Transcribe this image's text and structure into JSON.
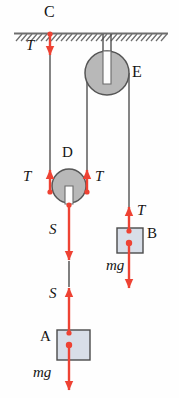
{
  "figure": {
    "colors": {
      "force_arrow": "#ee4233",
      "rope": "#4a4a4a",
      "pulley_fill": "#b8b8b8",
      "pulley_stroke": "#565656",
      "block_fill": "#d8dee8",
      "block_stroke": "#4a4a4a",
      "ceiling": "#7a7a7a",
      "text": "#141414"
    }
  },
  "ceiling": {
    "name": "fixed-support",
    "hatch_count": 30
  },
  "pulleys": [
    {
      "id": "E",
      "label": "E",
      "role": "fixed-pulley",
      "cx": 107,
      "cy": 73,
      "r": 22
    },
    {
      "id": "D",
      "label": "D",
      "role": "movable-pulley",
      "cx": 69,
      "cy": 186,
      "r": 17
    }
  ],
  "blocks": [
    {
      "id": "B",
      "label": "B",
      "x": 117,
      "y": 228,
      "w": 26,
      "h": 25
    },
    {
      "id": "A",
      "label": "A",
      "x": 57,
      "y": 330,
      "w": 33,
      "h": 30
    }
  ],
  "anchors": [
    {
      "id": "C",
      "label": "C",
      "role": "ceiling-attachment-point",
      "x": 50,
      "y": 33
    }
  ],
  "force_labels": [
    {
      "id": "T-ceiling",
      "text": "T",
      "x": 27,
      "y": 46,
      "attached_to": "C",
      "direction": "down"
    },
    {
      "id": "T-D-left",
      "text": "T",
      "x": 24,
      "y": 176,
      "attached_to": "pulley-D",
      "direction": "up"
    },
    {
      "id": "T-D-right",
      "text": "T",
      "x": 96,
      "y": 176,
      "attached_to": "pulley-D",
      "direction": "up"
    },
    {
      "id": "T-B",
      "text": "T",
      "x": 138,
      "y": 210,
      "attached_to": "block-B",
      "direction": "up"
    },
    {
      "id": "S-D",
      "text": "S",
      "x": 50,
      "y": 229,
      "attached_to": "pulley-D",
      "direction": "down"
    },
    {
      "id": "S-A",
      "text": "S",
      "x": 50,
      "y": 293,
      "attached_to": "block-A",
      "direction": "up"
    },
    {
      "id": "mg-B",
      "text": "mg",
      "x": 110,
      "y": 265,
      "attached_to": "block-B",
      "direction": "down"
    },
    {
      "id": "mg-A",
      "text": "mg",
      "x": 36,
      "y": 372,
      "attached_to": "block-A",
      "direction": "down"
    }
  ],
  "body_labels": [
    {
      "id": "label-C",
      "text": "C",
      "x": 44,
      "y": 8
    },
    {
      "id": "label-E",
      "text": "E",
      "x": 133,
      "y": 74
    },
    {
      "id": "label-D",
      "text": "D",
      "x": 62,
      "y": 154
    },
    {
      "id": "label-B",
      "text": "B",
      "x": 148,
      "y": 234
    },
    {
      "id": "label-A",
      "text": "A",
      "x": 40,
      "y": 337
    }
  ],
  "ropes": [
    {
      "id": "rope-C-to-D-left",
      "from": "C",
      "to": "pulley-D-left",
      "x": 50
    },
    {
      "id": "rope-D-right-to-E",
      "from": "pulley-D",
      "to": "pulley-E-left",
      "x": 87
    },
    {
      "id": "rope-E-to-B",
      "from": "pulley-E",
      "to": "block-B",
      "x": 129
    },
    {
      "id": "rope-D-to-A",
      "from": "pulley-D",
      "to": "block-A",
      "x": 69
    }
  ]
}
